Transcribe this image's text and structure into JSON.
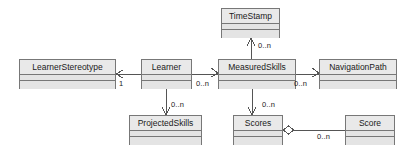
{
  "diagram": {
    "type": "uml-class-diagram",
    "colors": {
      "box_fill": "#e9e9e9",
      "compartment_fill": "#e4e4e4",
      "border": "#777777",
      "line": "#555555",
      "text": "#1a1a1a",
      "background": "#ffffff"
    },
    "classes": [
      {
        "id": "timestamp",
        "name": "TimeStamp",
        "x": 221,
        "y": 8,
        "w": 59,
        "h": 30
      },
      {
        "id": "learnerstereotype",
        "name": "LearnerStereotype",
        "x": 19,
        "y": 59,
        "w": 97,
        "h": 30
      },
      {
        "id": "learner",
        "name": "Learner",
        "x": 141,
        "y": 59,
        "w": 51,
        "h": 30
      },
      {
        "id": "measuredskills",
        "name": "MeasuredSkills",
        "x": 218,
        "y": 59,
        "w": 78,
        "h": 30
      },
      {
        "id": "navigationpath",
        "name": "NavigationPath",
        "x": 319,
        "y": 59,
        "w": 78,
        "h": 30
      },
      {
        "id": "projectedskills",
        "name": "ProjectedSkills",
        "x": 129,
        "y": 115,
        "w": 73,
        "h": 30
      },
      {
        "id": "scores",
        "name": "Scores",
        "x": 233,
        "y": 115,
        "w": 50,
        "h": 30
      },
      {
        "id": "score",
        "name": "Score",
        "x": 345,
        "y": 115,
        "w": 50,
        "h": 30
      }
    ],
    "associations": [
      {
        "id": "learner-to-learnerstereotype",
        "from": "learner",
        "to": "learnerstereotype",
        "multiplicity": "1",
        "arrow": "open",
        "direction": "left"
      },
      {
        "id": "learner-to-measuredskills",
        "from": "learner",
        "to": "measuredskills",
        "multiplicity": "0..n",
        "arrow": "open",
        "direction": "right"
      },
      {
        "id": "measuredskills-to-timestamp",
        "from": "measuredskills",
        "to": "timestamp",
        "multiplicity": "0..n",
        "arrow": "open",
        "direction": "up"
      },
      {
        "id": "measuredskills-to-navigationpath",
        "from": "measuredskills",
        "to": "navigationpath",
        "multiplicity": "0..n",
        "arrow": "open",
        "direction": "right"
      },
      {
        "id": "learner-to-projectedskills",
        "from": "learner",
        "to": "projectedskills",
        "multiplicity": "0..n",
        "arrow": "open",
        "direction": "down"
      },
      {
        "id": "measuredskills-to-scores",
        "from": "measuredskills",
        "to": "scores",
        "multiplicity": "0..n",
        "arrow": "open",
        "direction": "down"
      },
      {
        "id": "scores-to-score",
        "from": "scores",
        "to": "score",
        "multiplicity": "0..n",
        "arrow": "aggregation-diamond",
        "direction": "right"
      }
    ],
    "multiplicity_labels": [
      {
        "id": "mult-learnerstereotype",
        "text": "1",
        "x": 119,
        "y": 79
      },
      {
        "id": "mult-measuredskills-in",
        "text": "0..n",
        "x": 196,
        "y": 79
      },
      {
        "id": "mult-timestamp",
        "text": "0..n",
        "x": 258,
        "y": 41
      },
      {
        "id": "mult-navigationpath",
        "text": "0..n",
        "x": 294,
        "y": 79
      },
      {
        "id": "mult-projectedskills",
        "text": "0..n",
        "x": 171,
        "y": 100
      },
      {
        "id": "mult-scores",
        "text": "0..n",
        "x": 262,
        "y": 100
      },
      {
        "id": "mult-score",
        "text": "0..n",
        "x": 317,
        "y": 132
      }
    ]
  }
}
